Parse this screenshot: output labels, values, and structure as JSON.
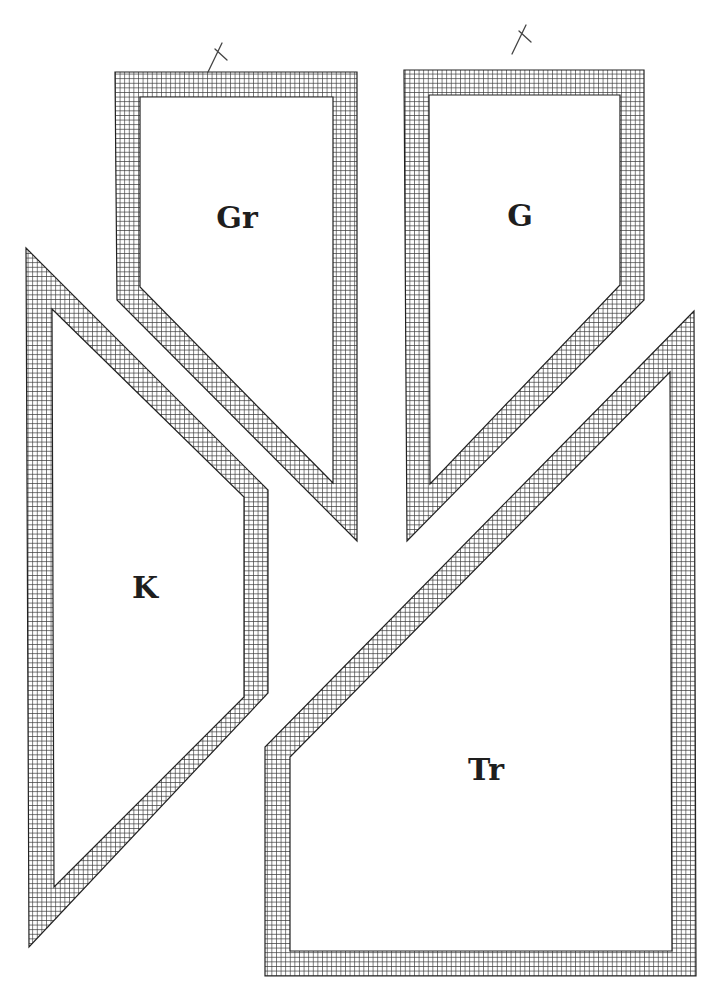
{
  "colors": {
    "background": "#ffffff",
    "outline": "#222222",
    "hatch": "#3a3a3a",
    "label": "#1e1e1e"
  },
  "pieces": [
    {
      "id": "Gr",
      "label": "Gr",
      "label_pos": [
        237,
        228
      ],
      "outer": [
        [
          115,
          72
        ],
        [
          357,
          72
        ],
        [
          357,
          541
        ],
        [
          117,
          300
        ]
      ],
      "inner": [
        [
          140,
          97
        ],
        [
          333,
          97
        ],
        [
          333,
          483
        ],
        [
          140,
          287
        ]
      ],
      "marker": "x",
      "marker_pos": [
        218,
        55
      ]
    },
    {
      "id": "G",
      "label": "G",
      "label_pos": [
        520,
        226
      ],
      "outer": [
        [
          404,
          70
        ],
        [
          644,
          70
        ],
        [
          644,
          300
        ],
        [
          407,
          541
        ]
      ],
      "inner": [
        [
          429,
          95
        ],
        [
          620,
          95
        ],
        [
          620,
          285
        ],
        [
          430,
          484
        ]
      ],
      "marker": "x",
      "marker_pos": [
        522,
        37
      ]
    },
    {
      "id": "K",
      "label": "K",
      "label_pos": [
        145,
        598
      ],
      "outer": [
        [
          26,
          248
        ],
        [
          268,
          490
        ],
        [
          268,
          693
        ],
        [
          29,
          947
        ]
      ],
      "inner": [
        [
          52,
          309
        ],
        [
          244,
          497
        ],
        [
          244,
          697
        ],
        [
          54,
          887
        ]
      ],
      "marker": null
    },
    {
      "id": "Tr",
      "label": "Tr",
      "label_pos": [
        486,
        780
      ],
      "outer": [
        [
          694,
          311
        ],
        [
          696,
          976
        ],
        [
          265,
          976
        ],
        [
          265,
          747
        ]
      ],
      "inner": [
        [
          670,
          372
        ],
        [
          672,
          951
        ],
        [
          290,
          951
        ],
        [
          290,
          757
        ]
      ],
      "marker": null
    }
  ]
}
